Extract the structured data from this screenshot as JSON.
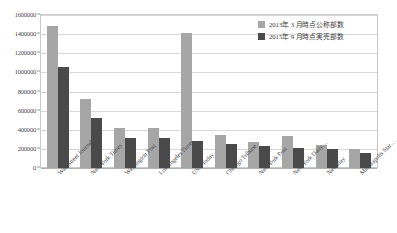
{
  "chart_data": {
    "type": "bar",
    "title": "",
    "xlabel": "",
    "ylabel": "",
    "ylim": [
      0,
      1600000
    ],
    "ytick_step": 200000,
    "yticks": [
      "1600000",
      "1400000",
      "1200000",
      "1000000",
      "800000",
      "600000",
      "400000",
      "200000",
      "0"
    ],
    "grid": true,
    "legend_position": "top-right",
    "categories": [
      "Wall Street Journal",
      "New York Times",
      "Washington Post",
      "Los Angeles Times",
      "USA Today",
      "Chicago Tribune",
      "New York Post",
      "New York Daily…",
      "Newsday",
      "Minneapolis Star…"
    ],
    "series": [
      {
        "name": "2013年 3 月時点公称部数",
        "color": "#a6a6a6",
        "values": [
          1480000,
          720000,
          420000,
          415000,
          1410000,
          350000,
          275000,
          335000,
          240000,
          200000
        ]
      },
      {
        "name": "2015年 9 月時点実売部数",
        "color": "#4a4a4a",
        "values": [
          1060000,
          520000,
          315000,
          312000,
          280000,
          250000,
          225000,
          205000,
          195000,
          155000
        ]
      }
    ]
  },
  "legend": {
    "items": [
      {
        "label": "2013年 3 月時点公称部数"
      },
      {
        "label": "2015年 9 月時点実売部数"
      }
    ]
  },
  "colors": {
    "series_a": "#a6a6a6",
    "series_b": "#4a4a4a",
    "grid": "#d8d8d8",
    "frame": "#c9c9c9"
  }
}
